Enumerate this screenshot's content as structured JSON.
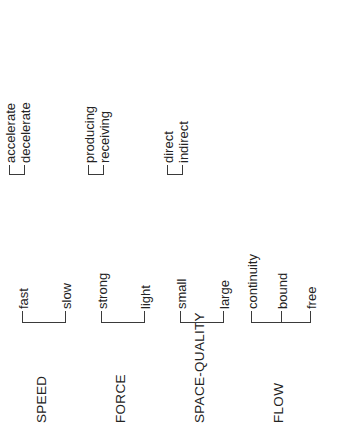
{
  "diagram": {
    "orientation": "rotated-90-ccw",
    "line_color": "#3a3a3a",
    "text_color": "#232323",
    "background": "#ffffff",
    "categories": [
      {
        "label": "SPEED",
        "children": [
          {
            "label": "fast",
            "children": [
              {
                "label": "accelerate"
              },
              {
                "label": "decelerate"
              }
            ]
          },
          {
            "label": "slow",
            "children": []
          }
        ]
      },
      {
        "label": "FORCE",
        "children": [
          {
            "label": "strong",
            "children": [
              {
                "label": "producing"
              },
              {
                "label": "receiving"
              }
            ]
          },
          {
            "label": "light",
            "children": []
          }
        ]
      },
      {
        "label": "SPACE-QUALITY",
        "children": [
          {
            "label": "small",
            "children": [
              {
                "label": "direct"
              },
              {
                "label": "indirect"
              }
            ]
          },
          {
            "label": "large",
            "children": []
          }
        ]
      },
      {
        "label": "FLOW",
        "children": [
          {
            "label": "continuity",
            "children": []
          },
          {
            "label": "bound",
            "children": []
          },
          {
            "label": "free",
            "children": []
          }
        ]
      }
    ]
  }
}
